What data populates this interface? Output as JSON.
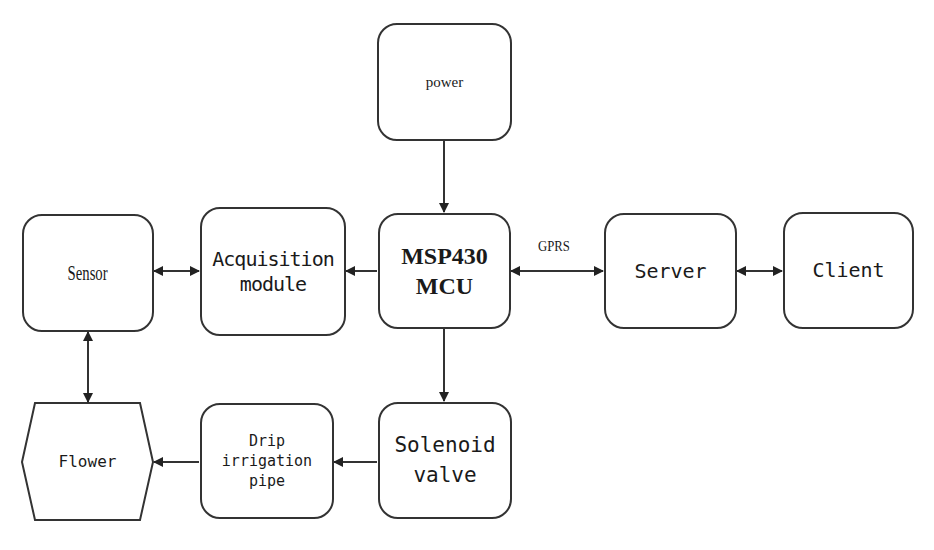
{
  "diagram": {
    "type": "block-diagram",
    "nodes": {
      "power": {
        "label": "power"
      },
      "sensor": {
        "label": "Sensor"
      },
      "acquisition": {
        "label": "Acquisition\nmodule"
      },
      "mcu": {
        "label": "MSP430\nMCU"
      },
      "server": {
        "label": "Server"
      },
      "client": {
        "label": "Client"
      },
      "flower": {
        "label": "Flower"
      },
      "drip": {
        "label": "Drip\nirrigation\npipe"
      },
      "solenoid": {
        "label": "Solenoid\nvalve"
      }
    },
    "edges": [
      {
        "from": "power",
        "to": "mcu",
        "direction": "forward",
        "label": ""
      },
      {
        "from": "sensor",
        "to": "acquisition",
        "direction": "bidirectional",
        "label": ""
      },
      {
        "from": "mcu",
        "to": "acquisition",
        "direction": "forward",
        "label": ""
      },
      {
        "from": "mcu",
        "to": "server",
        "direction": "bidirectional",
        "label": "GPRS"
      },
      {
        "from": "server",
        "to": "client",
        "direction": "bidirectional",
        "label": ""
      },
      {
        "from": "sensor",
        "to": "flower",
        "direction": "bidirectional",
        "label": ""
      },
      {
        "from": "mcu",
        "to": "solenoid",
        "direction": "forward",
        "label": ""
      },
      {
        "from": "solenoid",
        "to": "drip",
        "direction": "forward",
        "label": ""
      },
      {
        "from": "drip",
        "to": "flower",
        "direction": "forward",
        "label": ""
      }
    ],
    "edge_labels": {
      "gprs": "GPRS"
    },
    "colors": {
      "stroke": "#333333",
      "background": "#ffffff",
      "text": "#1a1a1a"
    }
  }
}
